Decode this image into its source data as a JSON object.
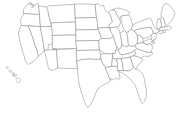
{
  "figure": {
    "kind": "outline-map",
    "subtitle": "",
    "caption": "",
    "labels_visible": false,
    "width_px": 181,
    "height_px": 120
  },
  "style": {
    "background_color": "#ffffff",
    "fill_color": "#ffffff",
    "border_color": "#8d8d8d",
    "island_border_color": "#9a9a9a",
    "stroke_width_px": 0.55
  },
  "map_data": {
    "type": "choropleth-outline",
    "region": "United States",
    "projection": "albers-usa",
    "shows_state_boundaries": true,
    "shows_national_boundary": true,
    "insets": [
      {
        "name": "hawaii",
        "position": "lower-left",
        "island_count": 6
      }
    ],
    "omitted_regions": [
      "Alaska"
    ],
    "legend": {
      "present": false,
      "entries": []
    },
    "annotations": [],
    "tick_labels": [],
    "states": [
      "Washington",
      "Oregon",
      "California",
      "Nevada",
      "Idaho",
      "Montana",
      "Wyoming",
      "Utah",
      "Arizona",
      "Colorado",
      "New Mexico",
      "North Dakota",
      "South Dakota",
      "Nebraska",
      "Kansas",
      "Oklahoma",
      "Texas",
      "Minnesota",
      "Iowa",
      "Missouri",
      "Arkansas",
      "Louisiana",
      "Wisconsin",
      "Illinois",
      "Michigan",
      "Indiana",
      "Ohio",
      "Kentucky",
      "Tennessee",
      "Mississippi",
      "Alabama",
      "Georgia",
      "Florida",
      "South Carolina",
      "North Carolina",
      "Virginia",
      "West Virginia",
      "Maryland",
      "Delaware",
      "Pennsylvania",
      "New Jersey",
      "New York",
      "Connecticut",
      "Rhode Island",
      "Massachusetts",
      "Vermont",
      "New Hampshire",
      "Maine",
      "Hawaii"
    ],
    "state_count": 49
  }
}
